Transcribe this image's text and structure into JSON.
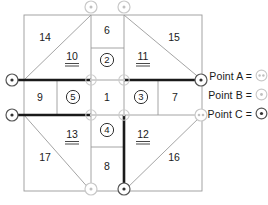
{
  "figure": {
    "type": "geometric-dissection-diagram"
  },
  "colors": {
    "thin_line": "#9a9a9a",
    "bold_line": "#1a1a1a",
    "text": "#1a1a1a",
    "marker_dark": "#3a3a3a",
    "marker_light": "#c8c8c8",
    "background": "#ffffff"
  },
  "pieces": {
    "plain": [
      {
        "label": "14",
        "x": 45,
        "y": 38
      },
      {
        "label": "6",
        "x": 105,
        "y": 31
      },
      {
        "label": "15",
        "x": 174,
        "y": 38
      },
      {
        "label": "9",
        "x": 40,
        "y": 97
      },
      {
        "label": "1",
        "x": 106,
        "y": 97
      },
      {
        "label": "7",
        "x": 175,
        "y": 97
      },
      {
        "label": "17",
        "x": 45,
        "y": 158
      },
      {
        "label": "8",
        "x": 105,
        "y": 165
      },
      {
        "label": "16",
        "x": 174,
        "y": 158
      }
    ],
    "underlined": [
      {
        "label": "10",
        "x": 72,
        "y": 57
      },
      {
        "label": "11",
        "x": 143,
        "y": 57
      },
      {
        "label": "13",
        "x": 72,
        "y": 135
      },
      {
        "label": "12",
        "x": 143,
        "y": 135
      }
    ],
    "circled": [
      {
        "label": "2",
        "x": 107,
        "y": 60
      },
      {
        "label": "5",
        "x": 73,
        "y": 97
      },
      {
        "label": "3",
        "x": 141,
        "y": 97
      },
      {
        "label": "4",
        "x": 107,
        "y": 130
      }
    ]
  },
  "markers": {
    "on_diagram": [
      {
        "name": "left-upper-point",
        "x": 12,
        "y": 80,
        "style": "dark"
      },
      {
        "name": "left-lower-point",
        "x": 12,
        "y": 115,
        "style": "dark"
      },
      {
        "name": "top-left-point",
        "x": 91,
        "y": 7,
        "style": "light"
      },
      {
        "name": "top-right-point",
        "x": 124,
        "y": 7,
        "style": "light"
      },
      {
        "name": "bottom-left-point",
        "x": 91,
        "y": 189,
        "style": "light"
      },
      {
        "name": "bottom-right-point",
        "x": 124,
        "y": 189,
        "style": "dark"
      },
      {
        "name": "right-upper-point",
        "x": 201,
        "y": 80,
        "style": "dark"
      },
      {
        "name": "right-lower-point",
        "x": 201,
        "y": 115,
        "style": "light-double"
      },
      {
        "name": "inner-top-left",
        "x": 91,
        "y": 80,
        "style": "faint"
      },
      {
        "name": "inner-top-right",
        "x": 124,
        "y": 80,
        "style": "faint"
      },
      {
        "name": "inner-bottom-left",
        "x": 91,
        "y": 115,
        "style": "faint"
      },
      {
        "name": "inner-bottom-right",
        "x": 124,
        "y": 115,
        "style": "faint"
      }
    ]
  },
  "legend": {
    "rows": [
      {
        "id": "a",
        "label": "Point A =",
        "marker": "light-double"
      },
      {
        "id": "b",
        "label": "Point B =",
        "marker": "light"
      },
      {
        "id": "c",
        "label": "Point C =",
        "marker": "dark"
      }
    ]
  },
  "geometry": {
    "outer_square": {
      "x": 24,
      "y": 15,
      "w": 178,
      "h": 176
    },
    "grid_x": [
      24,
      57,
      91,
      124,
      158,
      202
    ],
    "grid_y": [
      15,
      48,
      80,
      115,
      147,
      191
    ],
    "bold_segments": [
      {
        "x1": 12,
        "y1": 80,
        "x2": 91,
        "y2": 80
      },
      {
        "x1": 124,
        "y1": 80,
        "x2": 201,
        "y2": 80
      },
      {
        "x1": 12,
        "y1": 115,
        "x2": 91,
        "y2": 115
      },
      {
        "x1": 124,
        "y1": 115,
        "x2": 124,
        "y2": 189
      }
    ]
  }
}
